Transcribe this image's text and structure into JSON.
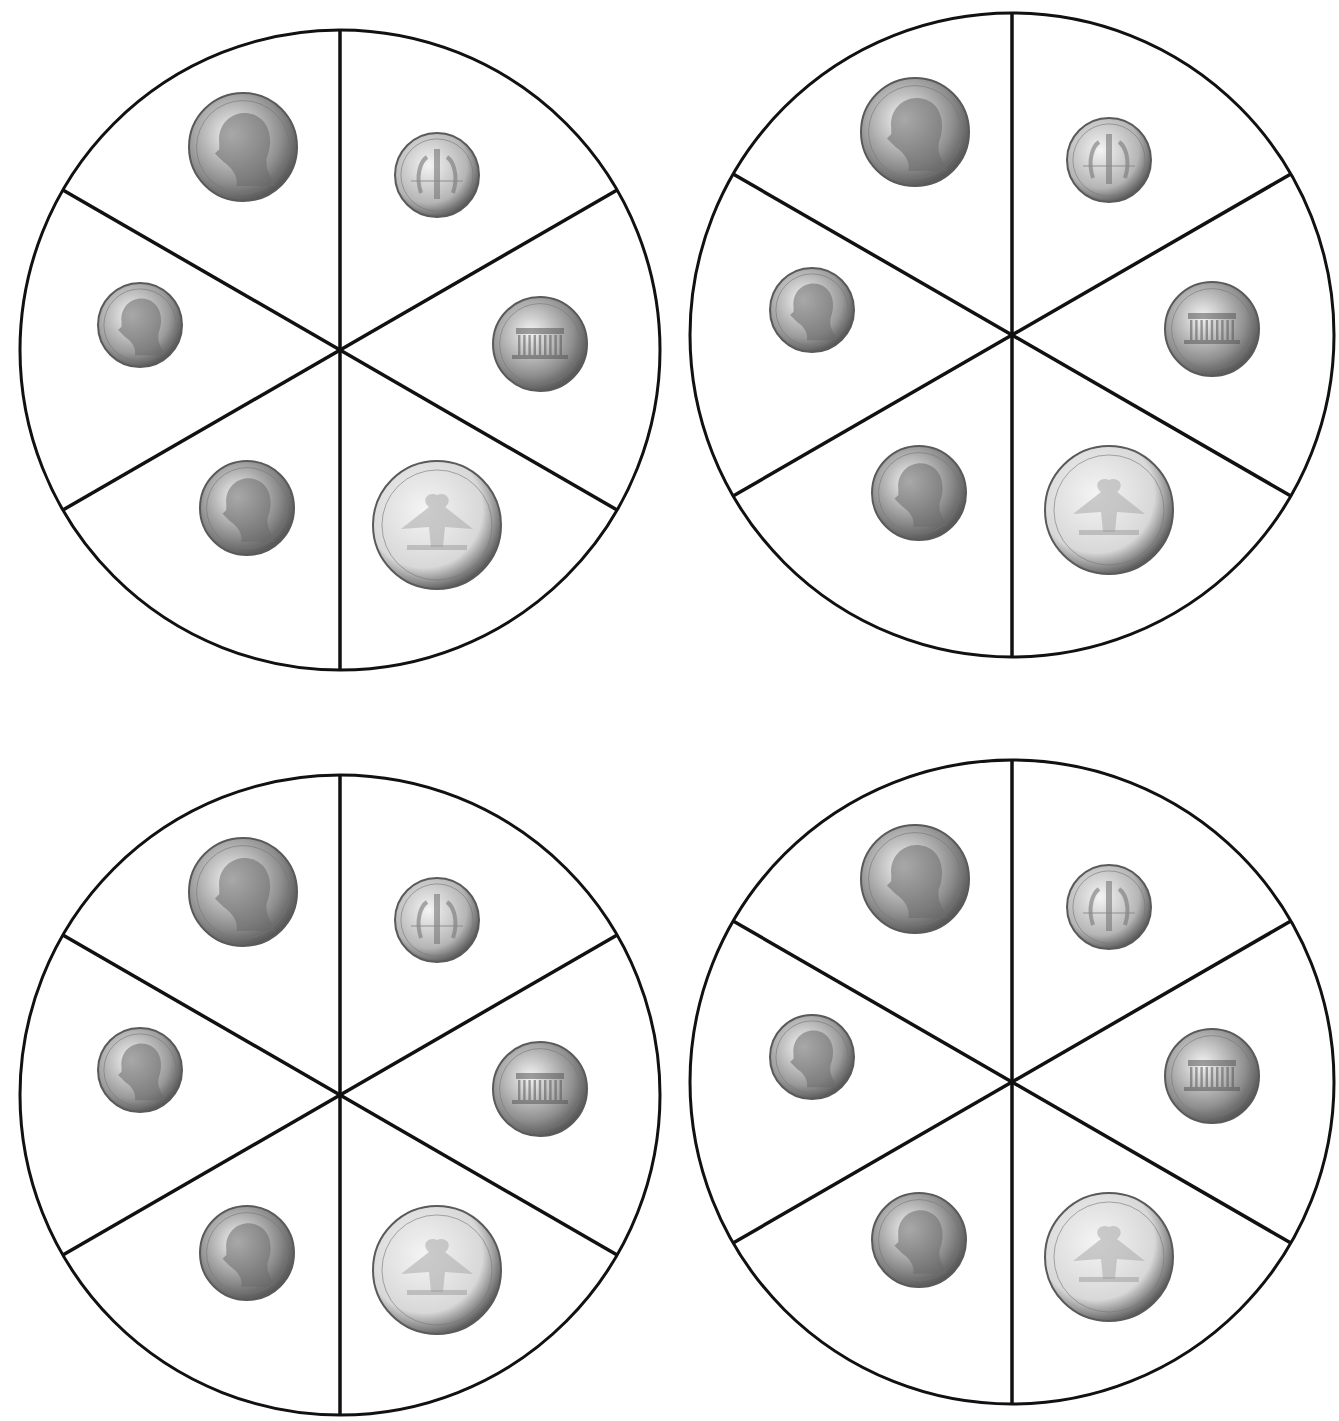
{
  "page": {
    "background": "#ffffff",
    "line_color": "#111111"
  },
  "spinners": [
    {
      "id": "top-left",
      "cx": 340,
      "cy": 350,
      "r": 320
    },
    {
      "id": "top-right",
      "cx": 1012,
      "cy": 335,
      "r": 322
    },
    {
      "id": "bottom-left",
      "cx": 340,
      "cy": 1095,
      "r": 320
    },
    {
      "id": "bottom-right",
      "cx": 1012,
      "cy": 1082,
      "r": 322
    }
  ],
  "sections": [
    {
      "position": "upper-left",
      "coin": "nickel",
      "side": "obverse",
      "label": "Nickel",
      "portrait": "Jefferson",
      "dx": -97,
      "dy": -203,
      "size": 108,
      "tone": "#8e8e8e"
    },
    {
      "position": "upper-right",
      "coin": "dime",
      "side": "reverse",
      "label": "Dime",
      "inscription": "ONE DIME",
      "dx": 97,
      "dy": -175,
      "size": 84,
      "tone": "#b5b5b5"
    },
    {
      "position": "left",
      "coin": "dime",
      "side": "obverse",
      "label": "Dime",
      "inscription": "LIBERTY",
      "portrait": "Roosevelt",
      "dx": -200,
      "dy": -25,
      "size": 84,
      "tone": "#9a9a9a"
    },
    {
      "position": "right",
      "coin": "penny",
      "side": "reverse",
      "label": "Penny",
      "inscription": "ONE CENT",
      "dx": 200,
      "dy": -6,
      "size": 94,
      "tone": "#8f8f8f"
    },
    {
      "position": "lower-left",
      "coin": "penny",
      "side": "obverse",
      "label": "Penny",
      "inscription": "LIBERTY",
      "portrait": "Lincoln",
      "dx": -93,
      "dy": 158,
      "size": 94,
      "tone": "#888888"
    },
    {
      "position": "lower-right",
      "coin": "quarter",
      "side": "reverse",
      "label": "Quarter",
      "inscription": "QUARTER DOLLAR",
      "dx": 97,
      "dy": 175,
      "size": 128,
      "tone": "#d8d8d8"
    }
  ]
}
